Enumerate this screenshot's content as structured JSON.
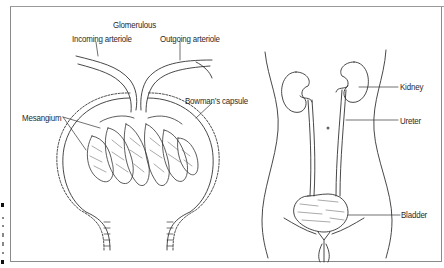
{
  "figure": {
    "type": "anatomical illustration",
    "panels": [
      {
        "name": "glomerulus-detail",
        "labels": {
          "glomerulous": "Glomerulous",
          "incoming_arteriole": "Incoming arteriole",
          "outgoing_arteriole": "Outgoing arteriole",
          "mesangium": "Mesangium",
          "bowmans_capsule": "Bowman’s capsule"
        }
      },
      {
        "name": "urinary-system",
        "labels": {
          "kidney": "Kidney",
          "ureter": "Ureter",
          "bladder": "Bladder"
        }
      }
    ]
  },
  "colors": {
    "ink": "#2a2a2a",
    "frame": "#8a8a8a",
    "background": "#ffffff"
  }
}
